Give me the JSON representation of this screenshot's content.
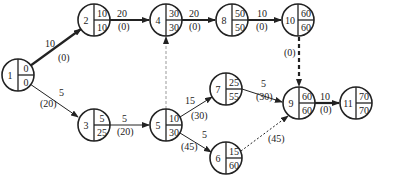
{
  "diagram": {
    "type": "activity-network",
    "nodes": [
      {
        "id": "1",
        "x": 18,
        "y": 75,
        "top": "0",
        "bottom": "0"
      },
      {
        "id": "2",
        "x": 94,
        "y": 20,
        "top": "10",
        "bottom": "10"
      },
      {
        "id": "3",
        "x": 94,
        "y": 125,
        "top": "5",
        "bottom": "25"
      },
      {
        "id": "4",
        "x": 166,
        "y": 20,
        "top": "30",
        "bottom": "30"
      },
      {
        "id": "5",
        "x": 166,
        "y": 125,
        "top": "10",
        "bottom": "30"
      },
      {
        "id": "6",
        "x": 226,
        "y": 158,
        "top": "15",
        "bottom": "60"
      },
      {
        "id": "7",
        "x": 226,
        "y": 89,
        "top": "25",
        "bottom": "55"
      },
      {
        "id": "8",
        "x": 232,
        "y": 20,
        "top": "50",
        "bottom": "50"
      },
      {
        "id": "9",
        "x": 299,
        "y": 103,
        "top": "60",
        "bottom": "60"
      },
      {
        "id": "10",
        "x": 298,
        "y": 20,
        "top": "60",
        "bottom": "60"
      },
      {
        "id": "11",
        "x": 356,
        "y": 103,
        "top": "70",
        "bottom": "70"
      }
    ],
    "edges": [
      {
        "from": "1",
        "to": "2",
        "duration": "10",
        "slack": "(0)",
        "style": "bold"
      },
      {
        "from": "1",
        "to": "3",
        "duration": "5",
        "slack": "(20)",
        "style": "thin"
      },
      {
        "from": "2",
        "to": "4",
        "duration": "20",
        "slack": "(0)",
        "style": "bold"
      },
      {
        "from": "3",
        "to": "5",
        "duration": "5",
        "slack": "(20)",
        "style": "thin"
      },
      {
        "from": "5",
        "to": "4",
        "duration": "",
        "slack": "",
        "style": "dashed"
      },
      {
        "from": "4",
        "to": "8",
        "duration": "20",
        "slack": "(0)",
        "style": "bold"
      },
      {
        "from": "8",
        "to": "10",
        "duration": "10",
        "slack": "(0)",
        "style": "bold"
      },
      {
        "from": "10",
        "to": "9",
        "duration": "",
        "slack": "(0)",
        "style": "bold-dashed"
      },
      {
        "from": "5",
        "to": "7",
        "duration": "15",
        "slack": "(30)",
        "style": "thin"
      },
      {
        "from": "5",
        "to": "6",
        "duration": "5",
        "slack": "(45)",
        "style": "thin"
      },
      {
        "from": "7",
        "to": "9",
        "duration": "5",
        "slack": "(30)",
        "style": "thin"
      },
      {
        "from": "6",
        "to": "9",
        "duration": "",
        "slack": "(45)",
        "style": "dashed"
      },
      {
        "from": "9",
        "to": "11",
        "duration": "10",
        "slack": "(0)",
        "style": "bold"
      }
    ]
  }
}
